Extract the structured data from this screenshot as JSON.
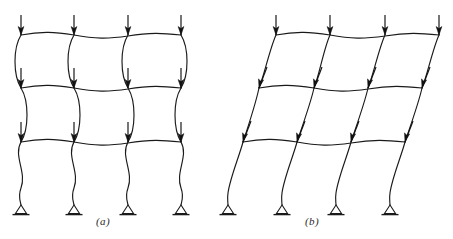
{
  "figure": {
    "background_color": "#ffffff",
    "line_color": "#1a1a1a",
    "width": 453,
    "height": 239
  },
  "captions": {
    "panel_a": "(a)",
    "panel_b": "(b)"
  },
  "panels": [
    {
      "id": "a",
      "label": "(a)",
      "name": "braced-frame-nonsway-buckling",
      "description": "Braced frame: symmetric double-curvature column buckling with no lateral sidesway",
      "sway": false,
      "sway_per_story_px": 0,
      "stories": 3,
      "bays": 3,
      "columns": 4,
      "column_x": [
        21,
        74,
        128,
        181
      ],
      "beam_levels_y": [
        35,
        88,
        142
      ],
      "base_y": 205,
      "load_arrow_top_y": 15,
      "load_arrow_tip_y": 35,
      "loads_per_level": 4,
      "loads_total": 12,
      "support_type": "pin"
    },
    {
      "id": "b",
      "label": "(b)",
      "name": "unbraced-frame-sway-buckling",
      "description": "Unbraced frame: sidesway buckling mode with columns leaning laterally",
      "sway": true,
      "sway_per_story_px": 16,
      "stories": 3,
      "bays": 3,
      "columns": 4,
      "column_x_top": [
        276,
        330,
        385,
        439
      ],
      "column_x_level2": [
        259,
        314,
        368,
        422
      ],
      "column_x_level3": [
        243,
        297,
        351,
        405
      ],
      "column_x_base": [
        228,
        282,
        336,
        390
      ],
      "beam_levels_y": [
        35,
        88,
        142
      ],
      "base_y": 205,
      "load_arrow_top_y": 15,
      "load_arrow_tip_y": 35,
      "loads_per_level": 4,
      "loads_total": 12,
      "support_type": "pin"
    }
  ],
  "legend": {
    "load_symbol": "down-arrow",
    "support_symbol": "pin-triangle"
  }
}
